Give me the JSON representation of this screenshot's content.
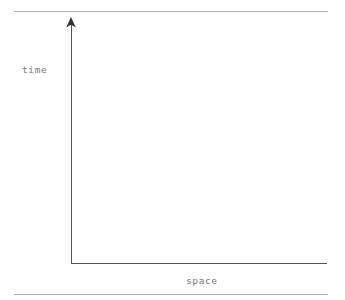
{
  "figure": {
    "name": "spacetime-axes-diagram",
    "background_color": "#ffffff",
    "width": 345,
    "height": 300
  },
  "rules": {
    "color": "#b3b3b3",
    "top_label": "",
    "bottom_label": ""
  },
  "chart_data": {
    "type": "scatter",
    "title": "",
    "subtitle": "",
    "xlabel": "space",
    "ylabel": "time",
    "x": [],
    "y": [],
    "series": [],
    "annotations": [],
    "legend": [],
    "legend_position": "none",
    "grid": false,
    "xlim": null,
    "ylim": null,
    "xticks": [],
    "yticks": [],
    "axis_style": {
      "color": "#555555",
      "line_width": 1,
      "y_axis_arrow": true,
      "x_axis_arrow": false,
      "origin_x": 71,
      "origin_y": 263,
      "x_axis_end": 327,
      "y_axis_top": 17
    }
  },
  "labels": {
    "y_axis": "time",
    "x_axis": "space",
    "color": "#787878"
  },
  "icons": {
    "y_axis_arrowhead": "arrow-up-icon"
  }
}
